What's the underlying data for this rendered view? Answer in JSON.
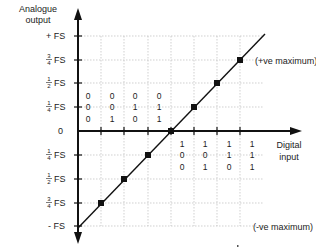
{
  "diagram": {
    "y_axis_title_line1": "Analogue",
    "y_axis_title_line2": "output",
    "x_axis_title_line1": "Digital",
    "x_axis_title_line2": "input",
    "annotation_top": "(+ve maximum)",
    "annotation_bottom": "(-ve maximum)",
    "y_labels": [
      {
        "prefix": "+",
        "num": "",
        "den": "",
        "unit": "FS",
        "value": 1.0
      },
      {
        "prefix": "",
        "num": "3",
        "den": "4",
        "unit": "FS",
        "value": 0.75
      },
      {
        "prefix": "",
        "num": "1",
        "den": "2",
        "unit": "FS",
        "value": 0.5
      },
      {
        "prefix": "",
        "num": "1",
        "den": "4",
        "unit": "FS",
        "value": 0.25
      },
      {
        "prefix": "",
        "num": "",
        "den": "",
        "unit": "0",
        "value": 0
      },
      {
        "prefix": "",
        "num": "1",
        "den": "4",
        "unit": "FS",
        "value": -0.25
      },
      {
        "prefix": "",
        "num": "1",
        "den": "2",
        "unit": "FS",
        "value": -0.5
      },
      {
        "prefix": "",
        "num": "3",
        "den": "4",
        "unit": "FS",
        "value": -0.75
      },
      {
        "prefix": "-",
        "num": "",
        "den": "",
        "unit": "FS",
        "value": -1.0
      }
    ],
    "codes_left": [
      [
        "0",
        "0",
        "0"
      ],
      [
        "0",
        "0",
        "1"
      ],
      [
        "0",
        "1",
        "0"
      ],
      [
        "0",
        "1",
        "1"
      ]
    ],
    "codes_right": [
      [
        "1",
        "0",
        "0"
      ],
      [
        "1",
        "0",
        "1"
      ],
      [
        "1",
        "1",
        "0"
      ],
      [
        "1",
        "1",
        "1"
      ]
    ],
    "points": [
      {
        "code": "001",
        "value": -0.75
      },
      {
        "code": "010",
        "value": -0.5
      },
      {
        "code": "011",
        "value": -0.25
      },
      {
        "code": "100",
        "value": 0
      },
      {
        "code": "101",
        "value": 0.25
      },
      {
        "code": "110",
        "value": 0.5
      },
      {
        "code": "111",
        "value": 0.75
      }
    ],
    "colors": {
      "line": "#111111",
      "grid": "#bbbbbb",
      "text": "#222222"
    }
  }
}
